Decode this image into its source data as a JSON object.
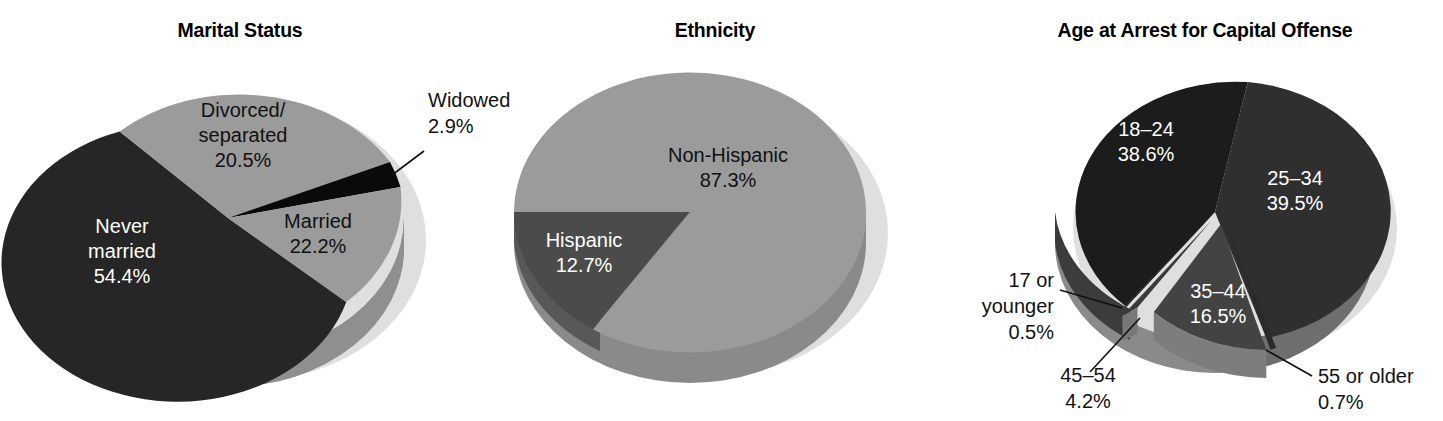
{
  "figure": {
    "background": "#ffffff",
    "width": 1443,
    "height": 421
  },
  "palette": {
    "very_dark": "#262626",
    "dark": "#2f2f2f",
    "mid_dark": "#404040",
    "mid": "#4b4b4b",
    "light_gray": "#9b9b9b",
    "side_gray": "#787878",
    "shadow": "#d6d6d6",
    "black": "#0a0a0a",
    "text_light": "#ffffff",
    "text_dark": "#111111"
  },
  "charts": [
    {
      "id": "marital-status",
      "title": "Marital Status",
      "labels": {
        "never_married": "Never\nmarried\n54.4%",
        "divorced": "Divorced/\nseparated\n20.5%",
        "widowed": "Widowed\n2.9%",
        "married": "Married\n22.2%"
      }
    },
    {
      "id": "ethnicity",
      "title": "Ethnicity",
      "labels": {
        "non_hispanic": "Non-Hispanic\n87.3%",
        "hispanic": "Hispanic\n12.7%"
      }
    },
    {
      "id": "age-at-arrest",
      "title": "Age at Arrest for Capital Offense",
      "labels": {
        "a18_24": "18–24\n38.6%",
        "a25_34": "25–34\n39.5%",
        "a35_44": "35–44\n16.5%",
        "a45_54": "45–54\n4.2%",
        "a17_younger": "17 or\nyounger\n0.5%",
        "a55_older": "55 or older\n0.7%"
      }
    }
  ],
  "chart_data": [
    {
      "type": "pie",
      "id": "marital-status",
      "title": "Marital Status",
      "unit": "percent",
      "three_d": true,
      "legend": "none",
      "labels_position": "inside-and-callout",
      "categories": [
        "Never married",
        "Divorced/separated",
        "Widowed",
        "Married"
      ],
      "values": [
        54.4,
        20.5,
        2.9,
        22.2
      ],
      "value_labels": [
        "54.4%",
        "20.5%",
        "2.9%",
        "22.2%"
      ],
      "slice_colors": [
        "#262626",
        "#9b9b9b",
        "#0a0a0a",
        "#9b9b9b"
      ],
      "label_text_colors": [
        "#ffffff",
        "#111111",
        "#111111",
        "#111111"
      ],
      "callouts": [
        "Widowed"
      ]
    },
    {
      "type": "pie",
      "id": "ethnicity",
      "title": "Ethnicity",
      "unit": "percent",
      "three_d": true,
      "legend": "none",
      "labels_position": "inside",
      "categories": [
        "Non-Hispanic",
        "Hispanic"
      ],
      "values": [
        87.3,
        12.7
      ],
      "value_labels": [
        "87.3%",
        "12.7%"
      ],
      "slice_colors": [
        "#9b9b9b",
        "#4b4b4b"
      ],
      "label_text_colors": [
        "#111111",
        "#ffffff"
      ],
      "callouts": []
    },
    {
      "type": "pie",
      "id": "age-at-arrest",
      "title": "Age at Arrest for Capital Offense",
      "unit": "percent",
      "three_d": true,
      "legend": "none",
      "labels_position": "inside-and-callout",
      "categories": [
        "18–24",
        "25–34",
        "35–44",
        "45–54",
        "17 or younger",
        "55 or older"
      ],
      "values": [
        38.6,
        39.5,
        16.5,
        4.2,
        0.5,
        0.7
      ],
      "value_labels": [
        "38.6%",
        "39.5%",
        "16.5%",
        "4.2%",
        "0.5%",
        "0.7%"
      ],
      "slice_colors": [
        "#1c1c1c",
        "#2f2f2f",
        "#434343",
        "#3a3a3a",
        "#2a2a2a",
        "#2a2a2a"
      ],
      "label_text_colors": [
        "#ffffff",
        "#ffffff",
        "#ffffff",
        "#111111",
        "#111111",
        "#111111"
      ],
      "callouts": [
        "45–54",
        "17 or younger",
        "55 or older"
      ]
    }
  ]
}
